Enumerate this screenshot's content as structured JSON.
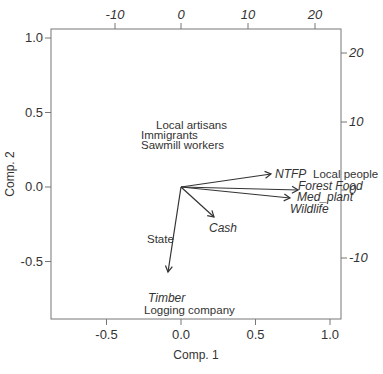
{
  "chart_data": {
    "type": "scatter",
    "subtype": "biplot",
    "title": "",
    "xlabel": "Comp. 1",
    "ylabel": "Comp. 2",
    "xlim": [
      -0.86,
      1.06
    ],
    "ylim": [
      -0.88,
      1.05
    ],
    "x_ticks": [
      "-0.5",
      "0.0",
      "0.5",
      "1.0"
    ],
    "y_ticks": [
      "-0.5",
      "0.0",
      "0.5",
      "1.0"
    ],
    "top_ticks": [
      "-10",
      "0",
      "10",
      "20"
    ],
    "right_ticks": [
      "20",
      "10",
      "0",
      "-10"
    ],
    "grid": false,
    "points": [
      {
        "label": "Local artisans",
        "x": 0.02,
        "y": 0.38
      },
      {
        "label": "Immigrants",
        "x": -0.06,
        "y": 0.32
      },
      {
        "label": "Sawmill workers",
        "x": -0.02,
        "y": 0.26
      },
      {
        "label": "Local people",
        "x": 0.92,
        "y": 0.11
      },
      {
        "label": "State",
        "x": -0.2,
        "y": -0.42
      },
      {
        "label": "Logging company",
        "x": 0.1,
        "y": -0.8
      }
    ],
    "vectors": [
      {
        "label": "NTFP",
        "x": 0.6,
        "y": 0.09
      },
      {
        "label": "Forest Food",
        "x": 0.78,
        "y": 0.0
      },
      {
        "label": "Med_plant",
        "x": 0.73,
        "y": -0.06
      },
      {
        "label": "Wildlife",
        "x": 0.73,
        "y": -0.06
      },
      {
        "label": "Cash",
        "x": 0.22,
        "y": -0.22
      },
      {
        "label": "Timber",
        "x": -0.08,
        "y": -0.63
      }
    ]
  }
}
